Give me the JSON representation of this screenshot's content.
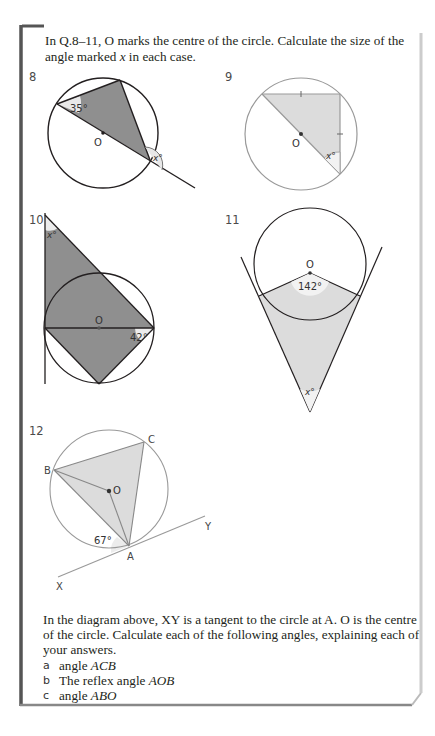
{
  "intro": {
    "text_part1": "In Q.8–11, O marks the centre of the circle. Calculate the size of the angle marked ",
    "var": "x",
    "text_part2": " in each case."
  },
  "questions": [
    {
      "number": "8",
      "labels": {
        "angle_given": "35°",
        "angle_unknown": "x°",
        "centre": "O"
      }
    },
    {
      "number": "9",
      "labels": {
        "angle_unknown": "x°",
        "centre": "O"
      }
    },
    {
      "number": "10",
      "labels": {
        "angle_given": "42°",
        "angle_unknown": "x°",
        "centre": "O"
      }
    },
    {
      "number": "11",
      "labels": {
        "angle_given": "142°",
        "angle_unknown": "x°",
        "centre": "O"
      }
    },
    {
      "number": "12",
      "labels": {
        "angle_given": "67°",
        "A": "A",
        "B": "B",
        "C": "C",
        "O": "O",
        "X": "X",
        "Y": "Y"
      }
    }
  ],
  "q12_text": {
    "paragraph": "In the diagram above, XY is a tangent to the circle at A. O is the centre of the circle. Calculate each of the following angles, explaining each of your answers.",
    "parts": [
      {
        "label": "a",
        "prefix": "angle ",
        "italic": "ACB"
      },
      {
        "label": "b",
        "prefix": "The reflex angle ",
        "italic": "AOB"
      },
      {
        "label": "c",
        "prefix": "angle ",
        "italic": "ABO"
      }
    ]
  },
  "colors": {
    "dark_fill": "#8f8f8f",
    "light_fill": "#dcdcdc",
    "frame": "#555555",
    "frame_right": "#cccccc"
  }
}
